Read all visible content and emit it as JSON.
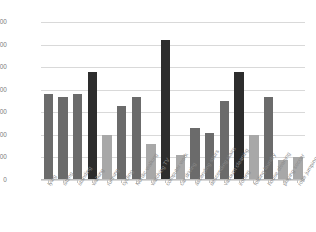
{
  "chart_data": {
    "type": "bar",
    "title": "",
    "subtitle": "",
    "xlabel": "",
    "ylabel": "",
    "ylim": [
      0,
      3500
    ],
    "yticks": [
      0,
      500,
      1000,
      1500,
      2000,
      2500,
      3000,
      3500
    ],
    "ytick_labels": [
      "0",
      "500",
      "1000",
      "1500",
      "2000",
      "2500",
      "3000",
      "3500"
    ],
    "grid": true,
    "legend": "none",
    "categories": [
      "lying",
      "sitting",
      "standing",
      "walking",
      "running",
      "cycling",
      "Nordic walking",
      "watching TV",
      "computer work",
      "car driving",
      "ascending stairs",
      "descending stairs",
      "vacuum cleaning",
      "ironing",
      "folding laundry",
      "house cleaning",
      "playing soccer",
      "rope jumping"
    ],
    "values": [
      1900,
      1850,
      1900,
      2400,
      1000,
      1650,
      1850,
      800,
      3100,
      550,
      1150,
      1050,
      1750,
      2400,
      1000,
      1850,
      450,
      500
    ],
    "bar_colors": [
      "#6b6b6b",
      "#6b6b6b",
      "#6b6b6b",
      "#2d2d2d",
      "#a8a8a8",
      "#6b6b6b",
      "#6b6b6b",
      "#a8a8a8",
      "#2d2d2d",
      "#a8a8a8",
      "#6b6b6b",
      "#6b6b6b",
      "#6b6b6b",
      "#2d2d2d",
      "#a8a8a8",
      "#6b6b6b",
      "#a8a8a8",
      "#a8a8a8"
    ]
  },
  "colors": {
    "background": "#ffffff",
    "gridline": "#d9d9d9",
    "axis": "#bdbdbd",
    "tick_text": "#7a7a7a",
    "label_text": "#8a8a8a",
    "bar_dark": "#2d2d2d",
    "bar_medium": "#6b6b6b",
    "bar_light": "#a8a8a8"
  }
}
